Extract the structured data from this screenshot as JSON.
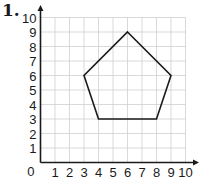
{
  "problem": {
    "number": "1."
  },
  "graph": {
    "x_range": [
      0,
      10
    ],
    "y_range": [
      0,
      10
    ],
    "x_ticks": [
      "1",
      "2",
      "3",
      "4",
      "5",
      "6",
      "7",
      "8",
      "9",
      "10"
    ],
    "y_ticks": [
      "1",
      "2",
      "3",
      "4",
      "5",
      "6",
      "7",
      "8",
      "9",
      "10"
    ],
    "origin_label": "0",
    "grid_color": "#cfcfcf",
    "axis_color": "#1a1a1a",
    "shape": {
      "type": "pentagon",
      "vertices": [
        [
          6,
          9
        ],
        [
          9,
          6
        ],
        [
          8,
          3
        ],
        [
          4,
          3
        ],
        [
          3,
          6
        ]
      ],
      "stroke": "#1a1a1a"
    }
  }
}
